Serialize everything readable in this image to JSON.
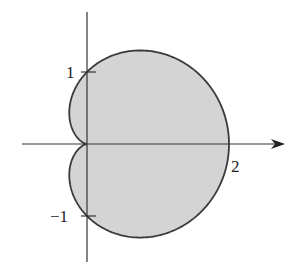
{
  "chart_data": {
    "type": "area",
    "title": "",
    "curve": "cardioid r = 1 + cos θ (polar)",
    "xlabel": "",
    "ylabel": "",
    "x_ticks": [
      {
        "value": 2,
        "label": "2"
      }
    ],
    "y_ticks": [
      {
        "value": 1,
        "label": "1"
      },
      {
        "value": -1,
        "label": "−1"
      }
    ],
    "xlim": [
      -0.9,
      2.8
    ],
    "ylim": [
      -1.7,
      1.85
    ],
    "grid": false,
    "legend": null,
    "fill_color": "#d4d4d4",
    "stroke_color": "#3a3a3a",
    "axis_color": "#333333",
    "key_points": [
      {
        "x": 0,
        "y": 0
      },
      {
        "x": 2,
        "y": 0
      },
      {
        "x": 0,
        "y": 1
      },
      {
        "x": 0,
        "y": -1
      },
      {
        "x": 0.75,
        "y": 1.299
      },
      {
        "x": 0.75,
        "y": -1.299
      },
      {
        "x": -0.25,
        "y": 0.433
      },
      {
        "x": -0.25,
        "y": -0.433
      }
    ]
  },
  "labels": {
    "x_tick_2": "2",
    "y_tick_1": "1",
    "y_tick_neg1": "−1"
  }
}
